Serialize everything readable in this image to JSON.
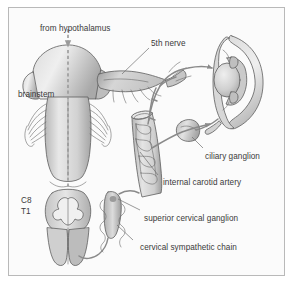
{
  "figure": {
    "border_color": "#b9b9b9",
    "background_color": "#fbfbfb",
    "ink_color": "#3a3a3a",
    "structure_fill_light": "#e3e3e3",
    "structure_fill_mid": "#c9c9c9",
    "structure_fill_dark": "#a8a8a8",
    "nerve_color": "#8a8a8a"
  },
  "labels": {
    "from_hypothalamus": "from hypothalamus",
    "fifth_nerve": "5th nerve",
    "brainstem": "brainstem",
    "cord_level_c8": "C8",
    "cord_level_t1": "T1",
    "ciliary_ganglion": "ciliary ganglion",
    "internal_carotid_artery": "internal carotid artery",
    "superior_cervical_ganglion": "superior cervical ganglion",
    "cervical_sympathetic_chain": "cervical sympathetic chain"
  },
  "structures": {
    "brainstem_name": "brainstem",
    "spinal_cord_name": "spinal cord cross-section",
    "eye_name": "eye sagittal section",
    "carotid_name": "internal carotid artery",
    "ciliary_ganglion_name": "ciliary ganglion",
    "superior_cervical_ganglion_name": "superior cervical ganglion",
    "sympathetic_chain_name": "cervical sympathetic chain",
    "trigeminal_name": "trigeminal (5th) nerve"
  }
}
